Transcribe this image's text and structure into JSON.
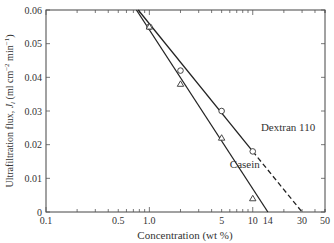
{
  "chart_data": {
    "type": "line",
    "title": "",
    "xlabel": "Concentration (wt %)",
    "ylabel": "Ultrafiltration flux, J_l (ml cm^-2 min^-1)",
    "ylabel_parts": {
      "main": "Ultrafiltration flux, ",
      "var": "J",
      "sub": "l",
      "units": " (ml cm",
      "exp1": "−2",
      "mid": " min",
      "exp2": "−1",
      "end": ")"
    },
    "xscale": "log",
    "xlim": [
      0.1,
      50
    ],
    "ylim": [
      0,
      0.06
    ],
    "grid": false,
    "legend": "inline labels",
    "x_tick_labels": [
      "0.1",
      "0.5",
      "1.0",
      "5",
      "10",
      "14",
      "30",
      "50"
    ],
    "x_tick_values": [
      0.1,
      0.5,
      1.0,
      5,
      10,
      14,
      30,
      50
    ],
    "y_tick_labels": [
      "0",
      "0.01",
      "0.02",
      "0.03",
      "0.04",
      "0.05",
      "0.06"
    ],
    "y_tick_values": [
      0,
      0.01,
      0.02,
      0.03,
      0.04,
      0.05,
      0.06
    ],
    "series": [
      {
        "name": "Dextran 110",
        "marker": "circle",
        "x": [
          1.0,
          2.0,
          5.0,
          10.0
        ],
        "values": [
          0.055,
          0.042,
          0.03,
          0.018
        ],
        "fit_line": {
          "style": "solid",
          "from": [
            0.78,
            0.06
          ],
          "to": [
            10,
            0.018
          ]
        },
        "extrapolation": {
          "style": "dashed",
          "from": [
            10,
            0.018
          ],
          "to": [
            30,
            0
          ]
        }
      },
      {
        "name": "Casein",
        "marker": "triangle",
        "x": [
          1.0,
          2.0,
          5.0,
          10.0
        ],
        "values": [
          0.055,
          0.038,
          0.022,
          0.004
        ],
        "fit_line": {
          "style": "solid",
          "from": [
            0.75,
            0.06
          ],
          "to": [
            14,
            0
          ]
        }
      }
    ],
    "annotations": [
      {
        "text": "Dextran 110",
        "x": 12,
        "y": 0.024
      },
      {
        "text": "Casein",
        "x": 6,
        "y": 0.013
      }
    ]
  }
}
